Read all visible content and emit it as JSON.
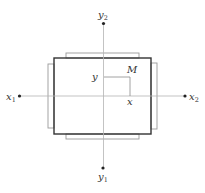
{
  "diagram": {
    "type": "coordinate-frame-schematic",
    "axes": {
      "horizontal": {
        "start_label": "x",
        "start_subscript": "1",
        "end_label": "x",
        "end_subscript": "2"
      },
      "vertical": {
        "bottom_label": "y",
        "bottom_subscript": "1",
        "top_label": "y",
        "top_subscript": "2"
      }
    },
    "point": {
      "label": "M",
      "x_projection_label": "x",
      "y_projection_label": "y"
    },
    "colors": {
      "frame": "#333333",
      "tabs": "#9a9a9a",
      "axes": "#b4b4b4",
      "points": "#222222"
    }
  }
}
